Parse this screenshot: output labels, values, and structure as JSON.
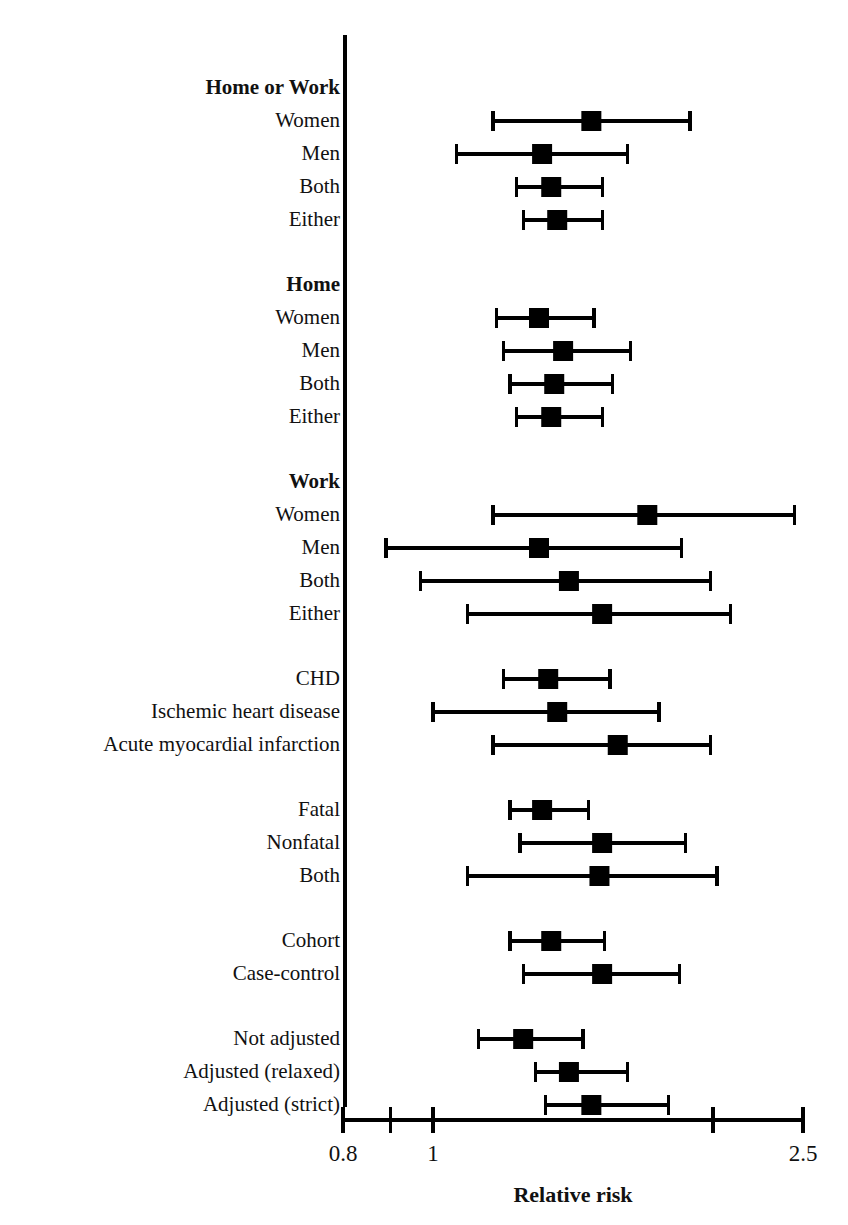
{
  "chart_data": {
    "type": "scatter",
    "subtype": "forest-plot",
    "title": "",
    "xlabel": "Relative risk",
    "ylabel": "",
    "xscale": "log",
    "xlim": [
      0.8,
      2.5
    ],
    "grid": false,
    "legend": null,
    "axis": {
      "tick_values": [
        0.8,
        0.9,
        1,
        2,
        2.5
      ],
      "tick_labels": [
        "0.8",
        "1",
        "2.5"
      ],
      "labeled_ticks": [
        0.8,
        1,
        2.5
      ]
    },
    "marker": {
      "shape": "square",
      "color": "#000000"
    },
    "error_bar": {
      "style": "capped-line",
      "color": "#000000"
    },
    "groups": [
      {
        "header": "Home or Work",
        "rows": [
          {
            "label": "Women",
            "estimate": 1.48,
            "ci_low": 1.16,
            "ci_high": 1.89
          },
          {
            "label": "Men",
            "estimate": 1.31,
            "ci_low": 1.06,
            "ci_high": 1.62
          },
          {
            "label": "Both",
            "estimate": 1.34,
            "ci_low": 1.23,
            "ci_high": 1.52
          },
          {
            "label": "Either",
            "estimate": 1.36,
            "ci_low": 1.25,
            "ci_high": 1.52
          }
        ]
      },
      {
        "header": "Home",
        "rows": [
          {
            "label": "Women",
            "estimate": 1.3,
            "ci_low": 1.17,
            "ci_high": 1.49
          },
          {
            "label": "Men",
            "estimate": 1.38,
            "ci_low": 1.19,
            "ci_high": 1.63
          },
          {
            "label": "Both",
            "estimate": 1.35,
            "ci_low": 1.21,
            "ci_high": 1.56
          },
          {
            "label": "Either",
            "estimate": 1.34,
            "ci_low": 1.23,
            "ci_high": 1.52
          }
        ]
      },
      {
        "header": "Work",
        "rows": [
          {
            "label": "Women",
            "estimate": 1.7,
            "ci_low": 1.16,
            "ci_high": 2.45
          },
          {
            "label": "Men",
            "estimate": 1.3,
            "ci_low": 0.89,
            "ci_high": 1.85
          },
          {
            "label": "Both",
            "estimate": 1.4,
            "ci_low": 0.97,
            "ci_high": 1.99
          },
          {
            "label": "Either",
            "estimate": 1.52,
            "ci_low": 1.09,
            "ci_high": 2.09
          }
        ]
      },
      {
        "header": "",
        "rows": [
          {
            "label": "CHD",
            "estimate": 1.33,
            "ci_low": 1.19,
            "ci_high": 1.55
          },
          {
            "label": "Ischemic heart disease",
            "estimate": 1.36,
            "ci_low": 1.0,
            "ci_high": 1.75
          },
          {
            "label": "Acute myocardial infarction",
            "estimate": 1.58,
            "ci_low": 1.16,
            "ci_high": 1.99
          }
        ]
      },
      {
        "header": "",
        "rows": [
          {
            "label": "Fatal",
            "estimate": 1.31,
            "ci_low": 1.21,
            "ci_high": 1.47
          },
          {
            "label": "Nonfatal",
            "estimate": 1.52,
            "ci_low": 1.24,
            "ci_high": 1.87
          },
          {
            "label": "Both",
            "estimate": 1.51,
            "ci_low": 1.09,
            "ci_high": 2.02
          }
        ]
      },
      {
        "header": "",
        "rows": [
          {
            "label": "Cohort",
            "estimate": 1.34,
            "ci_low": 1.21,
            "ci_high": 1.53
          },
          {
            "label": "Case-control",
            "estimate": 1.52,
            "ci_low": 1.25,
            "ci_high": 1.84
          }
        ]
      },
      {
        "header": "",
        "rows": [
          {
            "label": "Not adjusted",
            "estimate": 1.25,
            "ci_low": 1.12,
            "ci_high": 1.45
          },
          {
            "label": "Adjusted (relaxed)",
            "estimate": 1.4,
            "ci_low": 1.29,
            "ci_high": 1.62
          },
          {
            "label": "Adjusted (strict)",
            "estimate": 1.48,
            "ci_low": 1.32,
            "ci_high": 1.79
          }
        ]
      }
    ]
  },
  "layout": {
    "axis_x_px": 345,
    "axis_top_px": 35,
    "axis_bottom_px": 1110,
    "x_left_px": 343,
    "x_right_px": 803,
    "row_start_px": 88,
    "row_step_px": 33,
    "label_right_px": 340
  }
}
